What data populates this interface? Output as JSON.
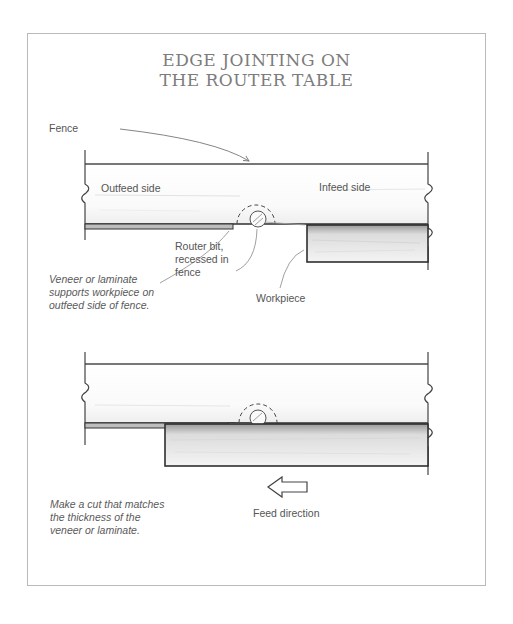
{
  "title": {
    "line1": "EDGE JOINTING ON",
    "line2": "THE ROUTER TABLE"
  },
  "diagram_top": {
    "labels": {
      "fence": "Fence",
      "outfeed_side": "Outfeed side",
      "infeed_side": "Infeed side",
      "router_bit": [
        "Router bit,",
        "recessed in",
        "fence"
      ],
      "workpiece": "Workpiece",
      "veneer_note": [
        "Veneer or laminate",
        "supports workpiece on",
        "outfeed side of fence."
      ]
    }
  },
  "diagram_bottom": {
    "labels": {
      "feed_direction": "Feed direction",
      "cut_note": [
        "Make a cut that matches",
        "the thickness of the",
        "veneer or laminate."
      ]
    },
    "arrow": "left-arrow"
  },
  "colors": {
    "line": "#3a3a3a",
    "frame": "#b9b9b9",
    "text": "#555555",
    "title": "#7c7c7c"
  }
}
